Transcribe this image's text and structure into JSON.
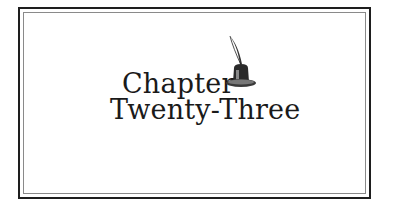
{
  "chapter": {
    "line1": "Chapter",
    "line2": "Twenty-Three"
  },
  "decoration": {
    "icon": "quill-inkwell-icon"
  },
  "colors": {
    "text": "#1a1a1a",
    "frame_outer": "#1e1e1e",
    "frame_inner": "#8a8a8a",
    "background": "#ffffff"
  }
}
